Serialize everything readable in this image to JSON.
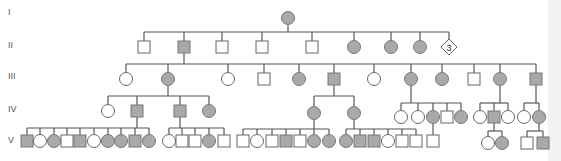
{
  "colors": {
    "affected": "#a9a9a9",
    "unaffected": "#ffffff",
    "line": "#555555"
  },
  "generations": [
    {
      "label": "I",
      "y": 15
    },
    {
      "label": "II",
      "y": 48
    },
    {
      "label": "III",
      "y": 79
    },
    {
      "label": "IV",
      "y": 112
    },
    {
      "label": "V",
      "y": 143
    }
  ],
  "legend_note": "Squares = male, circles = female, diamond = sex unspecified, shaded = affected",
  "individuals": [
    {
      "id": "I-1",
      "gen": "I",
      "sex": "female",
      "affected": true,
      "x": 288,
      "y": 18
    },
    {
      "id": "II-1",
      "gen": "II",
      "sex": "male",
      "affected": false,
      "x": 144,
      "y": 47
    },
    {
      "id": "II-2",
      "gen": "II",
      "sex": "male",
      "affected": true,
      "x": 184,
      "y": 47
    },
    {
      "id": "II-3",
      "gen": "II",
      "sex": "male",
      "affected": false,
      "x": 222,
      "y": 47
    },
    {
      "id": "II-4",
      "gen": "II",
      "sex": "male",
      "affected": false,
      "x": 262,
      "y": 47
    },
    {
      "id": "II-5",
      "gen": "II",
      "sex": "male",
      "affected": false,
      "x": 312,
      "y": 47
    },
    {
      "id": "II-6",
      "gen": "II",
      "sex": "female",
      "affected": true,
      "x": 354,
      "y": 47
    },
    {
      "id": "II-7",
      "gen": "II",
      "sex": "female",
      "affected": true,
      "x": 391,
      "y": 47
    },
    {
      "id": "II-8",
      "gen": "II",
      "sex": "female",
      "affected": true,
      "x": 420,
      "y": 47
    },
    {
      "id": "II-9",
      "gen": "II",
      "sex": "unknown",
      "affected": false,
      "x": 449,
      "y": 47,
      "count": "3"
    },
    {
      "id": "III-1",
      "gen": "III",
      "sex": "female",
      "affected": false,
      "x": 126,
      "y": 79
    },
    {
      "id": "III-2",
      "gen": "III",
      "sex": "female",
      "affected": true,
      "x": 168,
      "y": 79
    },
    {
      "id": "III-3",
      "gen": "III",
      "sex": "female",
      "affected": false,
      "x": 228,
      "y": 79
    },
    {
      "id": "III-4",
      "gen": "III",
      "sex": "male",
      "affected": false,
      "x": 264,
      "y": 79
    },
    {
      "id": "III-5",
      "gen": "III",
      "sex": "female",
      "affected": true,
      "x": 299,
      "y": 79
    },
    {
      "id": "III-6",
      "gen": "III",
      "sex": "male",
      "affected": true,
      "x": 334,
      "y": 79
    },
    {
      "id": "III-7",
      "gen": "III",
      "sex": "female",
      "affected": false,
      "x": 374,
      "y": 79
    },
    {
      "id": "III-8",
      "gen": "III",
      "sex": "female",
      "affected": true,
      "x": 411,
      "y": 79
    },
    {
      "id": "III-9",
      "gen": "III",
      "sex": "female",
      "affected": true,
      "x": 442,
      "y": 79
    },
    {
      "id": "III-10",
      "gen": "III",
      "sex": "male",
      "affected": false,
      "x": 474,
      "y": 79
    },
    {
      "id": "III-11",
      "gen": "III",
      "sex": "female",
      "affected": true,
      "x": 500,
      "y": 79
    },
    {
      "id": "III-12",
      "gen": "III",
      "sex": "male",
      "affected": true,
      "x": 536,
      "y": 79
    },
    {
      "id": "IV-1",
      "gen": "IV",
      "sex": "female",
      "affected": false,
      "x": 108,
      "y": 111
    },
    {
      "id": "IV-2",
      "gen": "IV",
      "sex": "male",
      "affected": true,
      "x": 137,
      "y": 111
    },
    {
      "id": "IV-3",
      "gen": "IV",
      "sex": "male",
      "affected": true,
      "x": 180,
      "y": 111
    },
    {
      "id": "IV-4",
      "gen": "IV",
      "sex": "female",
      "affected": true,
      "x": 209,
      "y": 111
    },
    {
      "id": "IV-5",
      "gen": "IV",
      "sex": "female",
      "affected": true,
      "x": 314,
      "y": 113
    },
    {
      "id": "IV-6",
      "gen": "IV",
      "sex": "female",
      "affected": true,
      "x": 354,
      "y": 113
    },
    {
      "id": "IV-7",
      "gen": "IV",
      "sex": "female",
      "affected": false,
      "x": 401,
      "y": 117
    },
    {
      "id": "IV-8",
      "gen": "IV",
      "sex": "female",
      "affected": false,
      "x": 418,
      "y": 117
    },
    {
      "id": "IV-9",
      "gen": "IV",
      "sex": "female",
      "affected": true,
      "x": 433,
      "y": 117
    },
    {
      "id": "IV-10",
      "gen": "IV",
      "sex": "male",
      "affected": false,
      "x": 447,
      "y": 117
    },
    {
      "id": "IV-11",
      "gen": "IV",
      "sex": "female",
      "affected": true,
      "x": 461,
      "y": 117
    },
    {
      "id": "IV-12",
      "gen": "IV",
      "sex": "female",
      "affected": false,
      "x": 480,
      "y": 117
    },
    {
      "id": "IV-13",
      "gen": "IV",
      "sex": "male",
      "affected": true,
      "x": 494,
      "y": 117
    },
    {
      "id": "IV-14",
      "gen": "IV",
      "sex": "female",
      "affected": false,
      "x": 508,
      "y": 117
    },
    {
      "id": "IV-15",
      "gen": "IV",
      "sex": "female",
      "affected": false,
      "x": 524,
      "y": 117
    },
    {
      "id": "IV-16",
      "gen": "IV",
      "sex": "female",
      "affected": true,
      "x": 539,
      "y": 117
    },
    {
      "id": "V-1",
      "gen": "V",
      "sex": "male",
      "affected": true,
      "x": 27,
      "y": 141
    },
    {
      "id": "V-2",
      "gen": "V",
      "sex": "female",
      "affected": false,
      "x": 40,
      "y": 141
    },
    {
      "id": "V-3",
      "gen": "V",
      "sex": "female",
      "affected": true,
      "x": 54,
      "y": 141
    },
    {
      "id": "V-4",
      "gen": "V",
      "sex": "male",
      "affected": false,
      "x": 67,
      "y": 141
    },
    {
      "id": "V-5",
      "gen": "V",
      "sex": "male",
      "affected": true,
      "x": 80,
      "y": 141
    },
    {
      "id": "V-6",
      "gen": "V",
      "sex": "female",
      "affected": false,
      "x": 94,
      "y": 141
    },
    {
      "id": "V-7",
      "gen": "V",
      "sex": "female",
      "affected": true,
      "x": 108,
      "y": 141
    },
    {
      "id": "V-8",
      "gen": "V",
      "sex": "female",
      "affected": true,
      "x": 121,
      "y": 141
    },
    {
      "id": "V-9",
      "gen": "V",
      "sex": "male",
      "affected": true,
      "x": 135,
      "y": 141
    },
    {
      "id": "V-10",
      "gen": "V",
      "sex": "female",
      "affected": true,
      "x": 149,
      "y": 141
    },
    {
      "id": "V-11",
      "gen": "V",
      "sex": "female",
      "affected": false,
      "x": 169,
      "y": 141
    },
    {
      "id": "V-12",
      "gen": "V",
      "sex": "male",
      "affected": false,
      "x": 182,
      "y": 141
    },
    {
      "id": "V-13",
      "gen": "V",
      "sex": "male",
      "affected": false,
      "x": 195,
      "y": 141
    },
    {
      "id": "V-14",
      "gen": "V",
      "sex": "female",
      "affected": true,
      "x": 209,
      "y": 141
    },
    {
      "id": "V-15",
      "gen": "V",
      "sex": "male",
      "affected": false,
      "x": 224,
      "y": 141
    },
    {
      "id": "V-16",
      "gen": "V",
      "sex": "male",
      "affected": false,
      "x": 243,
      "y": 141
    },
    {
      "id": "V-17",
      "gen": "V",
      "sex": "female",
      "affected": false,
      "x": 257,
      "y": 141
    },
    {
      "id": "V-18",
      "gen": "V",
      "sex": "male",
      "affected": false,
      "x": 272,
      "y": 141
    },
    {
      "id": "V-19",
      "gen": "V",
      "sex": "male",
      "affected": true,
      "x": 286,
      "y": 141
    },
    {
      "id": "V-20",
      "gen": "V",
      "sex": "male",
      "affected": false,
      "x": 300,
      "y": 141
    },
    {
      "id": "V-21",
      "gen": "V",
      "sex": "female",
      "affected": true,
      "x": 314,
      "y": 141
    },
    {
      "id": "V-22",
      "gen": "V",
      "sex": "female",
      "affected": true,
      "x": 329,
      "y": 141
    },
    {
      "id": "V-23",
      "gen": "V",
      "sex": "female",
      "affected": true,
      "x": 346,
      "y": 141
    },
    {
      "id": "V-24",
      "gen": "V",
      "sex": "male",
      "affected": true,
      "x": 360,
      "y": 141
    },
    {
      "id": "V-25",
      "gen": "V",
      "sex": "male",
      "affected": true,
      "x": 374,
      "y": 141
    },
    {
      "id": "V-26",
      "gen": "V",
      "sex": "female",
      "affected": false,
      "x": 388,
      "y": 141
    },
    {
      "id": "V-27",
      "gen": "V",
      "sex": "male",
      "affected": false,
      "x": 402,
      "y": 141
    },
    {
      "id": "V-28",
      "gen": "V",
      "sex": "male",
      "affected": false,
      "x": 416,
      "y": 141
    },
    {
      "id": "V-29",
      "gen": "V",
      "sex": "male",
      "affected": false,
      "x": 433,
      "y": 141
    },
    {
      "id": "V-30",
      "gen": "V",
      "sex": "female",
      "affected": false,
      "x": 488,
      "y": 143
    },
    {
      "id": "V-31",
      "gen": "V",
      "sex": "female",
      "affected": true,
      "x": 502,
      "y": 143
    },
    {
      "id": "V-32",
      "gen": "V",
      "sex": "male",
      "affected": false,
      "x": 527,
      "y": 143
    },
    {
      "id": "V-33",
      "gen": "V",
      "sex": "male",
      "affected": true,
      "x": 543,
      "y": 143
    }
  ],
  "lines": [
    [
      288,
      25,
      288,
      32
    ],
    [
      144,
      32,
      449,
      32
    ],
    [
      144,
      32,
      144,
      41
    ],
    [
      184,
      32,
      184,
      41
    ],
    [
      222,
      32,
      222,
      41
    ],
    [
      262,
      32,
      262,
      41
    ],
    [
      312,
      32,
      312,
      41
    ],
    [
      354,
      32,
      354,
      40
    ],
    [
      391,
      32,
      391,
      40
    ],
    [
      420,
      32,
      420,
      40
    ],
    [
      449,
      32,
      449,
      40
    ],
    [
      184,
      53,
      184,
      64
    ],
    [
      126,
      64,
      536,
      64
    ],
    [
      126,
      64,
      126,
      72
    ],
    [
      168,
      64,
      168,
      72
    ],
    [
      228,
      64,
      228,
      72
    ],
    [
      264,
      64,
      264,
      73
    ],
    [
      299,
      64,
      299,
      72
    ],
    [
      334,
      64,
      334,
      73
    ],
    [
      374,
      64,
      374,
      72
    ],
    [
      411,
      64,
      411,
      72
    ],
    [
      442,
      64,
      442,
      72
    ],
    [
      474,
      64,
      474,
      73
    ],
    [
      500,
      64,
      500,
      72
    ],
    [
      536,
      64,
      536,
      73
    ],
    [
      168,
      86,
      168,
      96
    ],
    [
      108,
      96,
      209,
      96
    ],
    [
      108,
      96,
      108,
      104
    ],
    [
      137,
      96,
      137,
      105
    ],
    [
      180,
      96,
      180,
      105
    ],
    [
      209,
      96,
      209,
      104
    ],
    [
      334,
      85,
      334,
      96
    ],
    [
      314,
      96,
      354,
      96
    ],
    [
      314,
      96,
      314,
      106
    ],
    [
      354,
      96,
      354,
      106
    ],
    [
      411,
      86,
      411,
      103
    ],
    [
      401,
      103,
      461,
      103
    ],
    [
      401,
      103,
      401,
      110
    ],
    [
      418,
      103,
      418,
      110
    ],
    [
      433,
      103,
      433,
      110
    ],
    [
      447,
      103,
      447,
      111
    ],
    [
      461,
      103,
      461,
      110
    ],
    [
      500,
      86,
      500,
      103
    ],
    [
      480,
      103,
      508,
      103
    ],
    [
      480,
      103,
      480,
      110
    ],
    [
      494,
      103,
      494,
      111
    ],
    [
      508,
      103,
      508,
      110
    ],
    [
      536,
      85,
      536,
      103
    ],
    [
      524,
      103,
      539,
      103
    ],
    [
      524,
      103,
      524,
      110
    ],
    [
      539,
      103,
      539,
      110
    ],
    [
      137,
      117,
      137,
      128
    ],
    [
      27,
      128,
      149,
      128
    ],
    [
      27,
      128,
      27,
      135
    ],
    [
      40,
      128,
      40,
      134
    ],
    [
      54,
      128,
      54,
      134
    ],
    [
      67,
      128,
      67,
      135
    ],
    [
      80,
      128,
      80,
      135
    ],
    [
      94,
      128,
      94,
      134
    ],
    [
      108,
      128,
      108,
      134
    ],
    [
      121,
      128,
      121,
      134
    ],
    [
      135,
      128,
      135,
      135
    ],
    [
      149,
      128,
      149,
      134
    ],
    [
      180,
      117,
      180,
      128
    ],
    [
      169,
      128,
      224,
      128
    ],
    [
      169,
      128,
      169,
      134
    ],
    [
      182,
      128,
      182,
      135
    ],
    [
      195,
      128,
      195,
      135
    ],
    [
      209,
      128,
      209,
      134
    ],
    [
      224,
      128,
      224,
      135
    ],
    [
      314,
      120,
      314,
      129
    ],
    [
      243,
      129,
      329,
      129
    ],
    [
      243,
      129,
      243,
      135
    ],
    [
      257,
      129,
      257,
      134
    ],
    [
      272,
      129,
      272,
      135
    ],
    [
      286,
      129,
      286,
      135
    ],
    [
      300,
      129,
      300,
      135
    ],
    [
      314,
      129,
      314,
      134
    ],
    [
      329,
      129,
      329,
      134
    ],
    [
      354,
      120,
      354,
      129
    ],
    [
      346,
      129,
      416,
      129
    ],
    [
      346,
      129,
      346,
      134
    ],
    [
      360,
      129,
      360,
      135
    ],
    [
      374,
      129,
      374,
      135
    ],
    [
      388,
      129,
      388,
      134
    ],
    [
      402,
      129,
      402,
      135
    ],
    [
      416,
      129,
      416,
      135
    ],
    [
      433,
      124,
      433,
      135
    ],
    [
      494,
      123,
      494,
      131
    ],
    [
      488,
      131,
      502,
      131
    ],
    [
      488,
      131,
      488,
      136
    ],
    [
      502,
      131,
      502,
      136
    ],
    [
      539,
      124,
      539,
      131
    ],
    [
      527,
      131,
      543,
      131
    ],
    [
      527,
      131,
      527,
      137
    ],
    [
      543,
      131,
      543,
      137
    ]
  ]
}
